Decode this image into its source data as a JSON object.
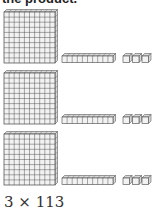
{
  "heading": {
    "text": "the product."
  },
  "blocks": {
    "rows": [
      {
        "hundreds": 1,
        "tens": 1,
        "ones": 3
      },
      {
        "hundreds": 1,
        "tens": 1,
        "ones": 3
      },
      {
        "hundreds": 1,
        "tens": 1,
        "ones": 3
      }
    ],
    "colors": {
      "stroke": "#444444",
      "fill": "#f2f2f2",
      "side": "#d8d8d8"
    }
  },
  "expression": {
    "text": "3 × 113"
  }
}
